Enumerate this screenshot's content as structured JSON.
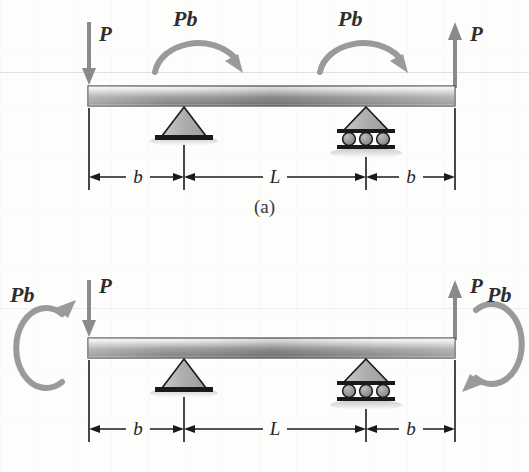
{
  "document": {
    "type": "engineering-beam-diagram",
    "background_color": "#fdfdfb"
  },
  "colors": {
    "beam_light": "#f2f2f2",
    "beam_mid": "#8f8f8f",
    "beam_dark": "#6d6d6d",
    "support_fill": "#a9a9a9",
    "support_stroke": "#1a1a1a",
    "arrow_gray": "#8a8a8a",
    "moment_arrow": "#9a9a9a",
    "dimension_line": "#1a1a1a",
    "text": "#2e2e2e"
  },
  "figures": [
    {
      "id": "a",
      "caption": "(a)",
      "loads": {
        "left_force": {
          "label": "P",
          "direction": "down",
          "position": "left-end"
        },
        "right_force": {
          "label": "P",
          "direction": "up",
          "position": "right-end"
        },
        "left_moment": {
          "label": "Pb",
          "sense": "clockwise",
          "position": "over-beam-left"
        },
        "right_moment": {
          "label": "Pb",
          "sense": "clockwise",
          "position": "over-beam-right"
        }
      },
      "supports": [
        {
          "type": "pin",
          "name": "pin-support"
        },
        {
          "type": "roller",
          "name": "roller-support",
          "rollers": 3
        }
      ],
      "dimensions": [
        {
          "label": "b",
          "segment": "left-overhang"
        },
        {
          "label": "L",
          "segment": "span"
        },
        {
          "label": "b",
          "segment": "right-overhang"
        }
      ]
    },
    {
      "id": "b",
      "caption": "(b)",
      "loads": {
        "left_force": {
          "label": "P",
          "direction": "down",
          "position": "left-end"
        },
        "right_force": {
          "label": "P",
          "direction": "up",
          "position": "right-end"
        },
        "left_moment": {
          "label": "Pb",
          "sense": "counterclockwise",
          "position": "left-of-beam-end"
        },
        "right_moment": {
          "label": "Pb",
          "sense": "clockwise",
          "position": "right-of-beam-end"
        }
      },
      "supports": [
        {
          "type": "pin",
          "name": "pin-support"
        },
        {
          "type": "roller",
          "name": "roller-support",
          "rollers": 3
        }
      ],
      "dimensions": [
        {
          "label": "b",
          "segment": "left-overhang"
        },
        {
          "label": "L",
          "segment": "span"
        },
        {
          "label": "b",
          "segment": "right-overhang"
        }
      ]
    }
  ],
  "labels": {
    "P": "P",
    "Pb": "Pb",
    "b": "b",
    "L": "L",
    "caption_a": "(a)",
    "caption_b": "(b)"
  }
}
